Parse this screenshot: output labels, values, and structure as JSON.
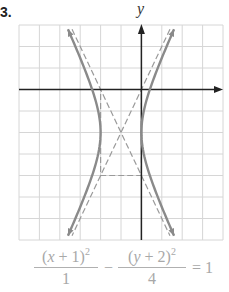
{
  "problem": {
    "number": "3."
  },
  "axes": {
    "y_label": "y",
    "x_label": ""
  },
  "equation": {
    "frac1": {
      "num_pre": "(",
      "num_var": "x",
      "num_post": " + 1)",
      "num_exp": "2",
      "den": "1"
    },
    "operator": "−",
    "frac2": {
      "num_pre": "(",
      "num_var": "y",
      "num_post": " + 2)",
      "num_exp": "2",
      "den": "4"
    },
    "rhs": "= 1"
  },
  "chart_data": {
    "type": "diagram",
    "title": "",
    "grid": {
      "x_range": [
        -6,
        4
      ],
      "y_range": [
        -7,
        3
      ],
      "step": 1,
      "grid_on": true
    },
    "hyperbola": {
      "center": [
        -1,
        -2
      ],
      "a": 1,
      "b": 2,
      "orientation": "horizontal",
      "vertices": [
        [
          -2,
          -2
        ],
        [
          0,
          -2
        ]
      ]
    },
    "asymptotes": [
      {
        "equation": "y + 2 = 2(x + 1)",
        "slope": 2
      },
      {
        "equation": "y + 2 = -2(x + 1)",
        "slope": -2
      }
    ],
    "rectangle": {
      "x": [
        -2,
        0
      ],
      "y": [
        -4,
        0
      ],
      "style": "dashed"
    },
    "colors": {
      "grid": "#d6d6d6",
      "axis": "#222222",
      "curve": "#8a8a8a",
      "dashed": "#9a9a9a",
      "equation": "#a8a8a8"
    }
  },
  "layout": {
    "origin_px": [
      141.4,
      89.5
    ],
    "unit_px": [
      20.4,
      21.5
    ],
    "grid_px": {
      "left": 19,
      "right": 223,
      "top": 25,
      "bottom": 240
    }
  }
}
